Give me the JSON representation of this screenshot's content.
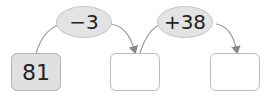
{
  "diagram": {
    "start_value": "81",
    "operations": [
      {
        "label": "−3"
      },
      {
        "label": "+38"
      }
    ],
    "boxes": [
      {
        "value": "81",
        "filled": true
      },
      {
        "value": "",
        "filled": false
      },
      {
        "value": "",
        "filled": false
      }
    ]
  }
}
